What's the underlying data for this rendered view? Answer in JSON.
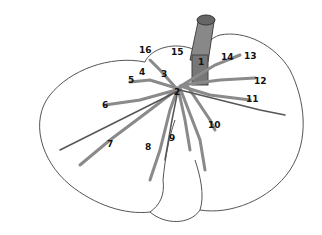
{
  "diagram": {
    "type": "anatomical illustration",
    "colors": {
      "outline": "#555555",
      "vessel": "#8a8a8a",
      "vessel_dark": "#555555",
      "label": "#111111"
    },
    "labels": [
      {
        "text": "1",
        "x": 198,
        "y": 62
      },
      {
        "text": "2",
        "x": 174,
        "y": 92
      },
      {
        "text": "3",
        "x": 161,
        "y": 74
      },
      {
        "text": "4",
        "x": 139,
        "y": 72
      },
      {
        "text": "5",
        "x": 128,
        "y": 80
      },
      {
        "text": "6",
        "x": 102,
        "y": 105
      },
      {
        "text": "7",
        "x": 107,
        "y": 144
      },
      {
        "text": "8",
        "x": 145,
        "y": 147
      },
      {
        "text": "9",
        "x": 169,
        "y": 138
      },
      {
        "text": "10",
        "x": 208,
        "y": 125
      },
      {
        "text": "11",
        "x": 246,
        "y": 99
      },
      {
        "text": "12",
        "x": 254,
        "y": 81
      },
      {
        "text": "13",
        "x": 244,
        "y": 56
      },
      {
        "text": "14",
        "x": 221,
        "y": 57
      },
      {
        "text": "15",
        "x": 171,
        "y": 52
      },
      {
        "text": "16",
        "x": 139,
        "y": 50
      }
    ]
  }
}
